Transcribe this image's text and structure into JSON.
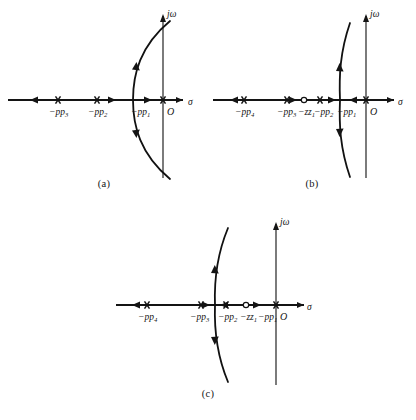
{
  "figure": {
    "kind": "root-locus-diagram-set",
    "panel_count": 3,
    "ink_color": "#141414",
    "background_color": "#ffffff"
  },
  "chart_data": [
    {
      "id": "a",
      "type": "scatter",
      "title": "",
      "caption": "(a)",
      "xlabel": "σ",
      "ylabel": "jω",
      "grid": false,
      "legend": null,
      "axis_labels": {
        "real": "σ",
        "imag": "jω",
        "origin": "O"
      },
      "xlim": [
        -8.2,
        1.6
      ],
      "ylim": [
        -4.6,
        4.6
      ],
      "poles": [
        {
          "label": "−p",
          "subscript": "3",
          "x": -6.0,
          "y": 0
        },
        {
          "label": "−p",
          "subscript": "2",
          "x": -3.8,
          "y": 0
        },
        {
          "label": "−p",
          "subscript": "1",
          "x": -0.85,
          "y": 0
        }
      ],
      "zeros": [],
      "origin": {
        "label": "O",
        "x": 0,
        "y": 0
      },
      "breakaway_x": -1.55,
      "locus_arc": {
        "shape": "open-right-parabola",
        "vertex_x": -1.55,
        "crosses_imaginary_axis": true,
        "top_end": [
          0.35,
          4.25
        ],
        "bottom_end": [
          0.35,
          -4.25
        ]
      },
      "real_axis_segments": [
        {
          "from": -8.2,
          "to": -6.0,
          "direction": "left"
        },
        {
          "from": -3.8,
          "to": -1.55,
          "direction": "right"
        },
        {
          "from": -1.55,
          "to": -0.85,
          "direction": "right"
        }
      ],
      "arrow_count": 6
    },
    {
      "id": "b",
      "type": "scatter",
      "title": "",
      "caption": "(b)",
      "xlabel": "σ",
      "ylabel": "jω",
      "grid": false,
      "legend": null,
      "axis_labels": {
        "real": "σ",
        "imag": "jω",
        "origin": "O"
      },
      "xlim": [
        -8.6,
        1.6
      ],
      "ylim": [
        -4.6,
        4.6
      ],
      "poles": [
        {
          "label": "−p",
          "subscript": "4",
          "x": -7.1,
          "y": 0
        },
        {
          "label": "−p",
          "subscript": "3",
          "x": -4.1,
          "y": 0
        },
        {
          "label": "−p",
          "subscript": "2",
          "x": -2.5,
          "y": 0
        },
        {
          "label": "−p",
          "subscript": "1",
          "x": -0.85,
          "y": 0
        }
      ],
      "zeros": [
        {
          "label": "−z",
          "subscript": "1",
          "x": -3.25,
          "y": 0
        }
      ],
      "origin": {
        "label": "O",
        "x": 0,
        "y": 0
      },
      "breakaway_x": -2.05,
      "locus_arc": {
        "shape": "open-right-parabola",
        "vertex_x": -2.05,
        "crosses_imaginary_axis": false,
        "top_end": [
          -0.95,
          4.05
        ],
        "bottom_end": [
          -0.95,
          -4.05
        ]
      },
      "real_axis_segments": [
        {
          "from": -8.6,
          "to": -7.1,
          "direction": "left"
        },
        {
          "from": -4.1,
          "to": -3.25,
          "direction": "right"
        },
        {
          "from": -2.5,
          "to": -2.05,
          "direction": "right"
        },
        {
          "from": -0.85,
          "to": -2.05,
          "direction": "left"
        }
      ],
      "arrow_count": 6
    },
    {
      "id": "c",
      "type": "scatter",
      "title": "",
      "caption": "(c)",
      "xlabel": "σ",
      "ylabel": "jω",
      "grid": false,
      "legend": null,
      "axis_labels": {
        "real": "σ",
        "imag": "jω",
        "origin": "O"
      },
      "xlim": [
        -8.6,
        1.6
      ],
      "ylim": [
        -4.6,
        4.6
      ],
      "poles": [
        {
          "label": "−p",
          "subscript": "4",
          "x": -7.2,
          "y": 0
        },
        {
          "label": "−p",
          "subscript": "3",
          "x": -4.3,
          "y": 0
        },
        {
          "label": "−p",
          "subscript": "2",
          "x": -3.0,
          "y": 0
        },
        {
          "label": "−p",
          "subscript": "1",
          "x": -0.95,
          "y": 0
        }
      ],
      "zeros": [
        {
          "label": "−z",
          "subscript": "1",
          "x": -1.95,
          "y": 0
        }
      ],
      "origin": {
        "label": "O",
        "x": 0,
        "y": 0
      },
      "breakaway_x": -3.62,
      "locus_arc": {
        "shape": "open-right-parabola",
        "vertex_x": -3.62,
        "crosses_imaginary_axis": false,
        "top_end": [
          -2.45,
          4.2
        ],
        "bottom_end": [
          -2.45,
          -4.2
        ]
      },
      "real_axis_segments": [
        {
          "from": -8.6,
          "to": -7.2,
          "direction": "left"
        },
        {
          "from": -4.3,
          "to": -3.62,
          "direction": "right"
        },
        {
          "from": -3.0,
          "to": -3.62,
          "direction": "left"
        },
        {
          "from": -1.95,
          "to": -0.95,
          "direction": "left"
        }
      ],
      "arrow_count": 6
    }
  ],
  "panels": {
    "a": {
      "caption": "(a)",
      "sigma_label": "σ",
      "jomega_label": "jω",
      "origin_label": "O",
      "minus": "−",
      "marks": [
        {
          "name": "pole-p3",
          "base": "p",
          "sub": "3"
        },
        {
          "name": "pole-p2",
          "base": "p",
          "sub": "2"
        },
        {
          "name": "pole-p1",
          "base": "p",
          "sub": "1"
        }
      ]
    },
    "b": {
      "caption": "(b)",
      "sigma_label": "σ",
      "jomega_label": "jω",
      "origin_label": "O",
      "minus": "−",
      "marks": [
        {
          "name": "pole-p4",
          "base": "p",
          "sub": "4"
        },
        {
          "name": "pole-p3",
          "base": "p",
          "sub": "3"
        },
        {
          "name": "zero-z1",
          "base": "z",
          "sub": "1"
        },
        {
          "name": "pole-p2",
          "base": "p",
          "sub": "2"
        },
        {
          "name": "pole-p1",
          "base": "p",
          "sub": "1"
        }
      ]
    },
    "c": {
      "caption": "(c)",
      "sigma_label": "σ",
      "jomega_label": "jω",
      "origin_label": "O",
      "minus": "−",
      "marks": [
        {
          "name": "pole-p4",
          "base": "p",
          "sub": "4"
        },
        {
          "name": "pole-p3",
          "base": "p",
          "sub": "3"
        },
        {
          "name": "pole-p2",
          "base": "p",
          "sub": "2"
        },
        {
          "name": "zero-z1",
          "base": "z",
          "sub": "1"
        },
        {
          "name": "pole-p1",
          "base": "p",
          "sub": "1"
        }
      ]
    }
  }
}
